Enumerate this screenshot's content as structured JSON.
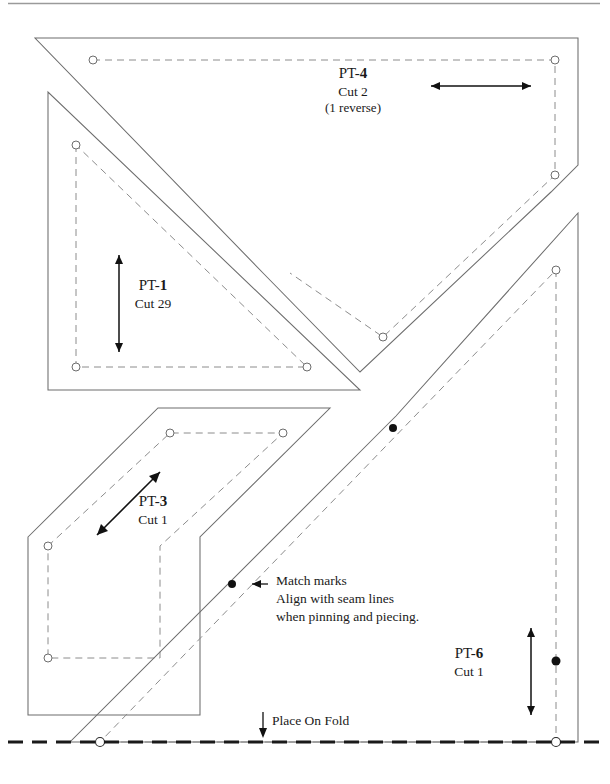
{
  "document": {
    "type": "quilt-pattern-template-sheet",
    "background_color": "#ffffff",
    "ink_color": "#1a1a1a",
    "cut_line_color": "#6d6d6d",
    "seam_line_color": "#8c8c8c",
    "fold_line_color": "#1a1a1a"
  },
  "pieces": [
    {
      "id": "pt4",
      "name_prefix": "PT-",
      "number": "4",
      "cut": "Cut 2",
      "note": "(1 reverse)",
      "grain_direction": "horizontal"
    },
    {
      "id": "pt1",
      "name_prefix": "PT-",
      "number": "1",
      "cut": "Cut 29",
      "note": "",
      "grain_direction": "vertical"
    },
    {
      "id": "pt3",
      "name_prefix": "PT-",
      "number": "3",
      "cut": "Cut 1",
      "note": "",
      "grain_direction": "diagonal"
    },
    {
      "id": "pt6",
      "name_prefix": "PT-",
      "number": "6",
      "cut": "Cut 1",
      "note": "",
      "grain_direction": "vertical"
    }
  ],
  "annotations": {
    "match_marks": {
      "line1": "Match marks",
      "line2": "Align with seam lines",
      "line3": "when pinning and piecing."
    },
    "fold": {
      "label": "Place On Fold"
    }
  }
}
